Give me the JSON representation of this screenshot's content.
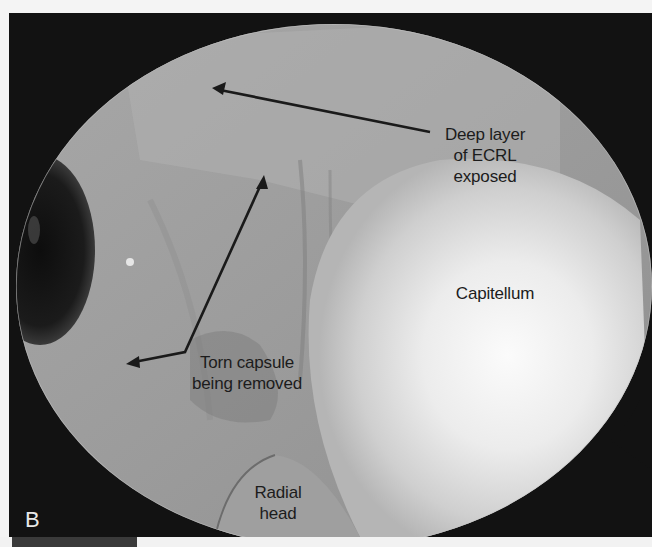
{
  "figure": {
    "panel_letter": "B",
    "colors": {
      "frame": "#111111",
      "tissue_mid": "#9a9a9a",
      "tissue_bright": "#f4f4f4",
      "label_text": "#1c1c1c",
      "panel_letter": "#e8e8e8"
    }
  },
  "labels": {
    "deep_layer_line1": "Deep layer",
    "deep_layer_line2": "of ECRL",
    "deep_layer_line3": "exposed",
    "capitellum": "Capitellum",
    "torn_capsule_line1": "Torn capsule",
    "torn_capsule_line2": "being removed",
    "radial_head_line1": "Radial",
    "radial_head_line2": "head"
  }
}
